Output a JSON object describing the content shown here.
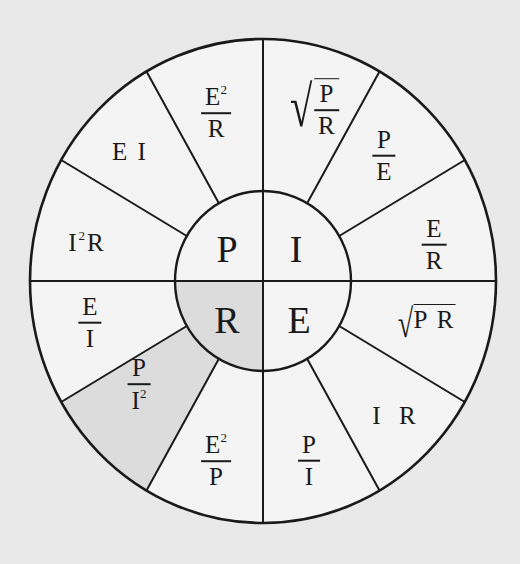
{
  "diagram": {
    "colors": {
      "background": "#e9e9e9",
      "wheel_fill": "#f4f4f4",
      "highlight_fill": "#dcdcdc",
      "stroke": "#1a1a1a"
    },
    "center": {
      "P": "P",
      "I": "I",
      "R": "R",
      "E": "E"
    },
    "quadrants": {
      "P": {
        "highlighted": false,
        "formulas": [
          {
            "id": "E2_over_R",
            "num": "E",
            "num_sup": "2",
            "den": "R"
          },
          {
            "id": "EI",
            "text": "E I"
          },
          {
            "id": "I2R",
            "pre": "I",
            "sup": "2",
            "post": "R"
          }
        ]
      },
      "I": {
        "highlighted": false,
        "formulas": [
          {
            "id": "sqrt_P_over_R",
            "num": "P",
            "den": "R"
          },
          {
            "id": "P_over_E",
            "num": "P",
            "den": "E"
          },
          {
            "id": "E_over_R",
            "num": "E",
            "den": "R"
          }
        ]
      },
      "R": {
        "highlighted": true,
        "formulas": [
          {
            "id": "E_over_I",
            "num": "E",
            "den": "I"
          },
          {
            "id": "P_over_I2",
            "num": "P",
            "den": "I",
            "den_sup": "2",
            "highlighted": true
          },
          {
            "id": "E2_over_P",
            "num": "E",
            "num_sup": "2",
            "den": "P"
          }
        ]
      },
      "E": {
        "highlighted": false,
        "formulas": [
          {
            "id": "sqrt_PR",
            "text": "P R"
          },
          {
            "id": "IR",
            "text": "I  R"
          },
          {
            "id": "P_over_I",
            "num": "P",
            "den": "I"
          }
        ]
      }
    }
  }
}
